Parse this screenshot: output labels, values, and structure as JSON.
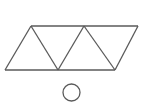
{
  "figure": {
    "background_color": "#ffffff",
    "stroke_color": "#5a5a5a",
    "stroke_width": 1.3,
    "canvas": {
      "width": 142,
      "height": 112
    },
    "triangle_strip": {
      "name": "triangle-strip",
      "description": "Row of five alternating triangles forming a parallelogram band",
      "triangle_count": 5,
      "top_edge": {
        "name": "top-edge",
        "x1": 31,
        "y1": 26,
        "x2": 138,
        "y2": 26
      },
      "bottom_edge": {
        "name": "bottom-edge",
        "x1": 5,
        "y1": 70,
        "x2": 115,
        "y2": 70
      },
      "top_vertices": [
        {
          "x": 31,
          "y": 26
        },
        {
          "x": 57.5,
          "y": 26
        },
        {
          "x": 84,
          "y": 26
        },
        {
          "x": 110.5,
          "y": 26
        },
        {
          "x": 138,
          "y": 26
        }
      ],
      "bottom_vertices": [
        {
          "x": 5,
          "y": 70
        },
        {
          "x": 31.5,
          "y": 70
        },
        {
          "x": 58,
          "y": 70
        },
        {
          "x": 84.5,
          "y": 70
        },
        {
          "x": 115,
          "y": 70
        }
      ],
      "diagonals": [
        {
          "name": "edge-1",
          "x1": 5,
          "y1": 70,
          "x2": 31,
          "y2": 26
        },
        {
          "name": "edge-2",
          "x1": 31,
          "y1": 26,
          "x2": 58,
          "y2": 70
        },
        {
          "name": "edge-3",
          "x1": 58,
          "y1": 70,
          "x2": 84,
          "y2": 26
        },
        {
          "name": "edge-4",
          "x1": 84,
          "y1": 26,
          "x2": 115,
          "y2": 70
        },
        {
          "name": "edge-5",
          "x1": 115,
          "y1": 70,
          "x2": 138,
          "y2": 26
        }
      ]
    },
    "circle": {
      "name": "circle-shape",
      "cx": 71.5,
      "cy": 92.5,
      "r": 8.5
    }
  }
}
